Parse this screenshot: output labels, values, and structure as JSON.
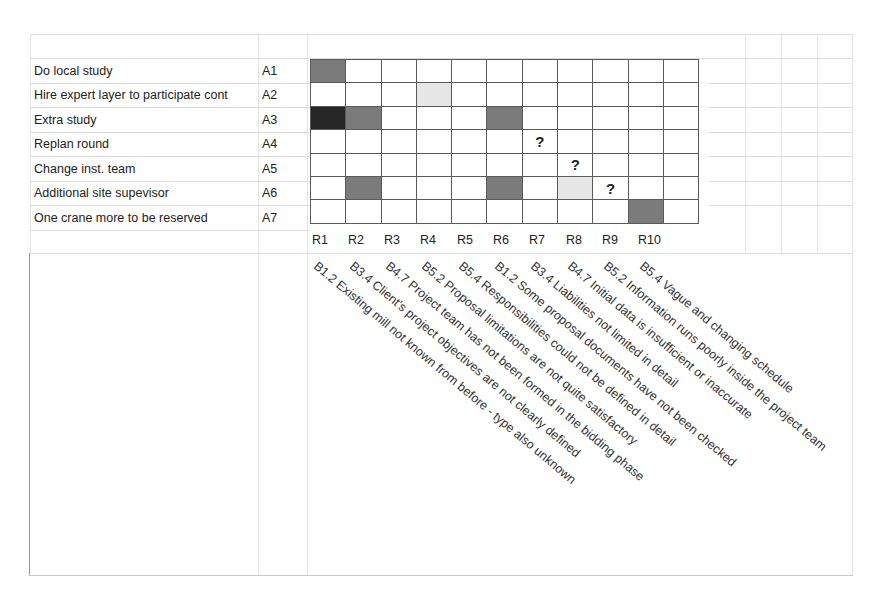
{
  "actions": [
    {
      "label": "Do local study",
      "code": "A1"
    },
    {
      "label": "Hire expert layer to participate cont",
      "code": "A2"
    },
    {
      "label": "Extra study",
      "code": "A3"
    },
    {
      "label": "Replan round",
      "code": "A4"
    },
    {
      "label": "Change inst. team",
      "code": "A5"
    },
    {
      "label": "Additional site supevisor",
      "code": "A6"
    },
    {
      "label": "One crane more to be reserved",
      "code": "A7"
    }
  ],
  "risks": [
    {
      "code": "R1",
      "description": "B1.2 Existing mill not known from before - type also unknown"
    },
    {
      "code": "R2",
      "description": "B3.4 Client's project objectives are not clearly defined"
    },
    {
      "code": "R3",
      "description": "B4.7 Project team has not been formed in the bidding phase"
    },
    {
      "code": "R4",
      "description": "B5.2 Proposal limitations are not quite satisfactory"
    },
    {
      "code": "R5",
      "description": "B5.4 Responsibilities could not be defined in detail"
    },
    {
      "code": "R6",
      "description": "B1.2 Some proposal documents have not been checked"
    },
    {
      "code": "R7",
      "description": "B3.4 Liabilities not limited in detail"
    },
    {
      "code": "R8",
      "description": "B4.7 Initial data is insufficient or inaccurate"
    },
    {
      "code": "R9",
      "description": "B5.2 Information runs poorly inside the project team"
    },
    {
      "code": "R10",
      "description": "B5.4 Vague and changing schedule"
    }
  ],
  "matrix": {
    "legend": {
      "dark": "strong effect",
      "medium": "effect",
      "light": "weak effect",
      "question": "?"
    },
    "colors": {
      "dark": "#262626",
      "medium": "#7b7b7b",
      "light": "#e0e0e0",
      "border": "#5a5a5a"
    },
    "rows": [
      [
        "medium",
        "",
        "",
        "",
        "",
        "",
        "",
        "",
        "",
        "",
        ""
      ],
      [
        "",
        "",
        "",
        "light",
        "",
        "",
        "",
        "",
        "",
        "",
        ""
      ],
      [
        "dark",
        "medium",
        "",
        "",
        "",
        "medium",
        "",
        "",
        "",
        "",
        ""
      ],
      [
        "",
        "",
        "",
        "",
        "",
        "",
        "?",
        "",
        "",
        "",
        ""
      ],
      [
        "",
        "",
        "",
        "",
        "",
        "",
        "",
        "?",
        "",
        "",
        ""
      ],
      [
        "",
        "medium",
        "",
        "",
        "",
        "medium",
        "",
        "light",
        "?",
        "",
        ""
      ],
      [
        "",
        "",
        "",
        "",
        "",
        "",
        "",
        "",
        "",
        "medium",
        ""
      ]
    ]
  }
}
